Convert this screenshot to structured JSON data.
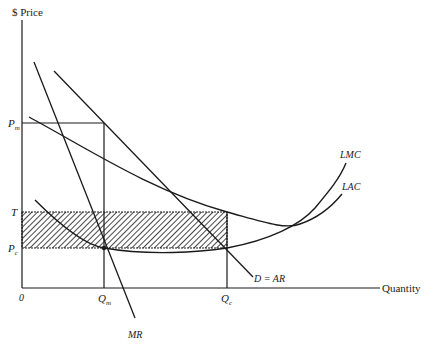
{
  "diagram": {
    "y_axis_label": "$ Price",
    "x_axis_label": "Quantity",
    "origin_label": "0",
    "price_labels": {
      "pm": {
        "main": "P",
        "sub": "m"
      },
      "t": {
        "main": "T"
      },
      "pc": {
        "main": "P",
        "sub": "c"
      }
    },
    "quantity_labels": {
      "qm": {
        "main": "Q",
        "sub": "m"
      },
      "qc": {
        "main": "Q",
        "sub": "c"
      }
    },
    "curve_labels": {
      "lmc": "LMC",
      "lac": "LAC",
      "demand": "D = AR",
      "mr": "MR"
    },
    "shaded_region": "Rectangle between T and Pc from 0 to Qc (hatched)",
    "colors": {
      "ink": "#1a1a1a",
      "background": "#ffffff"
    }
  }
}
